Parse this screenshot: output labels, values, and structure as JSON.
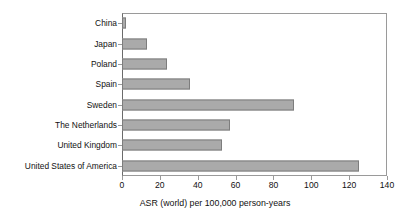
{
  "chart_data": {
    "type": "bar",
    "orientation": "horizontal",
    "title": "",
    "xlabel": "ASR (world) per 100,000 person-years",
    "ylabel": "",
    "categories": [
      "China",
      "Japan",
      "Poland",
      "Spain",
      "Sweden",
      "The Netherlands",
      "United Kingdom",
      "United States of America"
    ],
    "values": [
      2,
      13,
      24,
      36,
      91,
      57,
      53,
      125
    ],
    "xlim": [
      0,
      140
    ],
    "xticks": [
      0,
      20,
      40,
      60,
      80,
      100,
      120,
      140
    ],
    "xtick_labels": [
      "0",
      "20",
      "40",
      "60",
      "80",
      "100",
      "120",
      "140"
    ],
    "grid": false,
    "legend": false,
    "bar_color": "#aaaaaa",
    "bar_edge_color": "#7d7d7d",
    "frame_color": "#9a9a9a"
  }
}
